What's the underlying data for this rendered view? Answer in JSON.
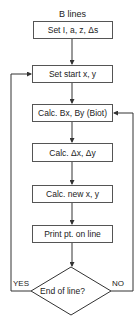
{
  "title": "B lines",
  "boxes": [
    {
      "label": "Set I, a, z, Δs"
    },
    {
      "label": "Set start x, y"
    },
    {
      "label": "Calc. Bx, By (Biot)"
    },
    {
      "label": "Calc. Δx, Δy"
    },
    {
      "label": "Calc. new x, y"
    },
    {
      "label": "Print pt. on line"
    }
  ],
  "decision": {
    "label": "End of line?",
    "yes_label": "YES",
    "no_label": "NO"
  }
}
